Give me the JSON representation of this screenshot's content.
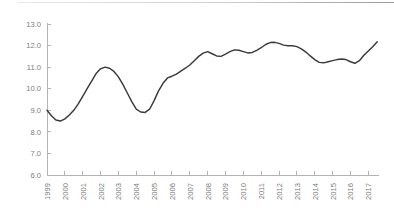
{
  "chart_data": {
    "type": "line",
    "title": "",
    "subtitle": "",
    "xlabel": "",
    "ylabel": "",
    "xlim": [
      1999,
      2017.6
    ],
    "ylim": [
      6.0,
      13.0
    ],
    "grid": false,
    "legend": null,
    "legend_position": "none",
    "line_color": "#3a3a3a",
    "axis_color": "#b4b4b4",
    "tick_label_color": "#7d7d7d",
    "background_color": "#ffffff",
    "y_ticks": [
      "6.0",
      "7.0",
      "8.0",
      "9.0",
      "10.0",
      "11.0",
      "12.0",
      "13.0"
    ],
    "y_tick_values": [
      6.0,
      7.0,
      8.0,
      9.0,
      10.0,
      11.0,
      12.0,
      13.0
    ],
    "x_ticks": [
      "1999",
      "2000",
      "2001",
      "2002",
      "2003",
      "2004",
      "2005",
      "2006",
      "2007",
      "2008",
      "2009",
      "2010",
      "2011",
      "2012",
      "2013",
      "2014",
      "2015",
      "2016",
      "2017"
    ],
    "x_tick_values": [
      1999,
      2000,
      2001,
      2002,
      2003,
      2004,
      2005,
      2006,
      2007,
      2008,
      2009,
      2010,
      2011,
      2012,
      2013,
      2014,
      2015,
      2016,
      2017
    ],
    "series": [
      {
        "name": "series-1",
        "x": [
          1999.0,
          1999.25,
          1999.5,
          1999.75,
          2000.0,
          2000.25,
          2000.5,
          2000.75,
          2001.0,
          2001.25,
          2001.5,
          2001.75,
          2002.0,
          2002.25,
          2002.5,
          2002.75,
          2003.0,
          2003.25,
          2003.5,
          2003.75,
          2004.0,
          2004.25,
          2004.5,
          2004.75,
          2005.0,
          2005.25,
          2005.5,
          2005.75,
          2006.0,
          2006.25,
          2006.5,
          2006.75,
          2007.0,
          2007.25,
          2007.5,
          2007.75,
          2008.0,
          2008.25,
          2008.5,
          2008.75,
          2009.0,
          2009.25,
          2009.5,
          2009.75,
          2010.0,
          2010.25,
          2010.5,
          2010.75,
          2011.0,
          2011.25,
          2011.5,
          2011.75,
          2012.0,
          2012.25,
          2012.5,
          2012.75,
          2013.0,
          2013.25,
          2013.5,
          2013.75,
          2014.0,
          2014.25,
          2014.5,
          2014.75,
          2015.0,
          2015.25,
          2015.5,
          2015.75,
          2016.0,
          2016.25,
          2016.5,
          2016.75,
          2017.0,
          2017.25,
          2017.5
        ],
        "values": [
          9.0,
          8.75,
          8.55,
          8.5,
          8.6,
          8.78,
          9.0,
          9.3,
          9.65,
          10.0,
          10.35,
          10.7,
          10.92,
          11.0,
          10.95,
          10.8,
          10.55,
          10.2,
          9.8,
          9.4,
          9.05,
          8.92,
          8.9,
          9.05,
          9.45,
          9.9,
          10.25,
          10.5,
          10.58,
          10.68,
          10.82,
          10.95,
          11.1,
          11.3,
          11.5,
          11.65,
          11.72,
          11.62,
          11.52,
          11.5,
          11.6,
          11.72,
          11.8,
          11.78,
          11.72,
          11.66,
          11.68,
          11.78,
          11.9,
          12.05,
          12.14,
          12.15,
          12.1,
          12.02,
          11.99,
          11.99,
          11.95,
          11.85,
          11.7,
          11.52,
          11.35,
          11.22,
          11.2,
          11.25,
          11.3,
          11.35,
          11.38,
          11.35,
          11.25,
          11.18,
          11.3,
          11.55,
          11.75,
          11.95,
          12.18
        ]
      }
    ]
  }
}
